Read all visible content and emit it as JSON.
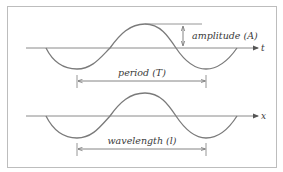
{
  "diagram": {
    "top_wave": {
      "axis_label": "t",
      "amplitude_label": "amplitude (A)",
      "span_label": "period (T)"
    },
    "bottom_wave": {
      "axis_label": "x",
      "span_label": "wavelength (l)"
    },
    "colors": {
      "line": "#7a7a7a",
      "text": "#3a3a3a",
      "frame": "#bdbdbd",
      "background": "#ffffff"
    }
  }
}
